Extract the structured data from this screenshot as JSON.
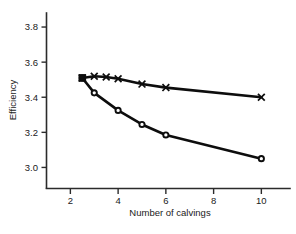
{
  "chart_data": {
    "type": "line",
    "title": "",
    "xlabel": "Number of calvings",
    "ylabel": "Efficiency",
    "xlim": [
      1.0,
      11.2
    ],
    "ylim": [
      2.88,
      3.88
    ],
    "xticks": [
      2,
      4,
      6,
      8,
      10
    ],
    "xtick_labels": [
      "2",
      "4",
      "6",
      "8",
      "10"
    ],
    "yticks": [
      3.0,
      3.2,
      3.4,
      3.6,
      3.8
    ],
    "ytick_labels": [
      "3.0",
      "3.2",
      "3.4",
      "3.6",
      "3.8"
    ],
    "grid": false,
    "legend": "none",
    "series": [
      {
        "name": "upper-curve-x-markers",
        "marker": "x",
        "x": [
          2.5,
          3.0,
          3.5,
          4.0,
          5.0,
          6.0,
          10.0
        ],
        "values": [
          3.51,
          3.52,
          3.515,
          3.505,
          3.475,
          3.455,
          3.4
        ]
      },
      {
        "name": "lower-curve-circle-markers",
        "marker": "circle",
        "x": [
          2.5,
          3.0,
          4.0,
          5.0,
          6.0,
          10.0
        ],
        "values": [
          3.51,
          3.425,
          3.325,
          3.245,
          3.185,
          3.05
        ]
      }
    ],
    "start_marker": {
      "name": "shared-origin-square",
      "marker": "filled-square",
      "x": 2.5,
      "y": 3.51
    }
  },
  "caption": {
    "partial_text": ""
  }
}
